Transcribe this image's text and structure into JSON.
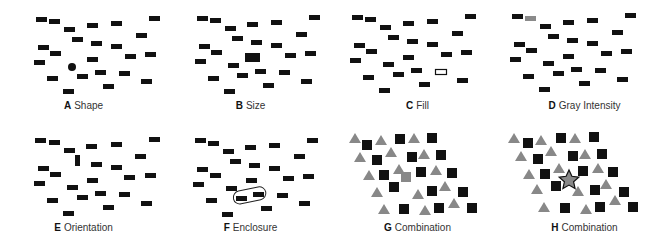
{
  "panels": [
    {
      "letter": "A",
      "label": "Shape"
    },
    {
      "letter": "B",
      "label": "Size"
    },
    {
      "letter": "C",
      "label": "Fill"
    },
    {
      "letter": "D",
      "label": "Gray Intensity"
    },
    {
      "letter": "E",
      "label": "Orientation"
    },
    {
      "letter": "F",
      "label": "Enclosure"
    },
    {
      "letter": "G",
      "label": "Combination"
    },
    {
      "letter": "H",
      "label": "Combination"
    }
  ],
  "colors": {
    "distractor": "#111111",
    "gray": "#8a8a8a",
    "triangle": "#888888",
    "background": "#ffffff"
  }
}
